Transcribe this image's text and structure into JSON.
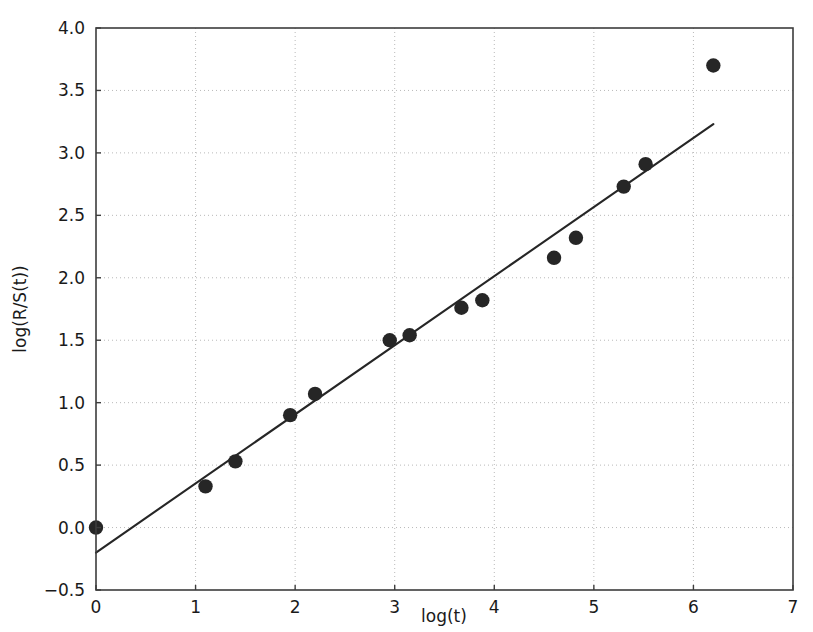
{
  "chart_data": {
    "type": "scatter",
    "title": "",
    "xlabel": "log(t)",
    "ylabel": "log(R/S(t))",
    "xlim": [
      0,
      7
    ],
    "ylim": [
      -0.5,
      4.0
    ],
    "grid": true,
    "legend": null,
    "xticks": [
      0,
      1,
      2,
      3,
      4,
      5,
      6,
      7
    ],
    "xtick_labels": [
      "0",
      "1",
      "2",
      "3",
      "4",
      "5",
      "6",
      "7"
    ],
    "yticks": [
      -0.5,
      0.0,
      0.5,
      1.0,
      1.5,
      2.0,
      2.5,
      3.0,
      3.5,
      4.0
    ],
    "ytick_labels": [
      "−0.5",
      "0.0",
      "0.5",
      "1.0",
      "1.5",
      "2.0",
      "2.5",
      "3.0",
      "3.5",
      "4.0"
    ],
    "marker_color": "#262626",
    "line_color": "#262626",
    "series": [
      {
        "name": "log(R/S(t)) observations",
        "type": "scatter",
        "marker": "filled-circle",
        "x": [
          0.0,
          1.1,
          1.4,
          1.95,
          2.2,
          2.95,
          3.15,
          3.67,
          3.88,
          4.6,
          4.82,
          5.3,
          5.52,
          6.2
        ],
        "y": [
          0.0,
          0.33,
          0.53,
          0.9,
          1.07,
          1.5,
          1.54,
          1.76,
          1.82,
          2.16,
          2.32,
          2.73,
          2.91,
          3.7
        ]
      },
      {
        "name": "linear fit",
        "type": "line",
        "x": [
          0.0,
          6.2
        ],
        "y": [
          -0.2,
          3.23
        ]
      }
    ]
  },
  "axes": {
    "x_axis_name": "log(t)",
    "y_axis_name": "log(R/S(t))"
  }
}
